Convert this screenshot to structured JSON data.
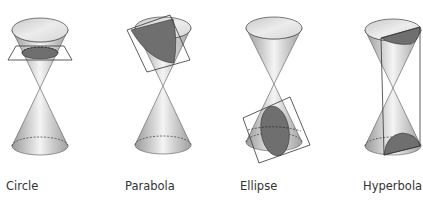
{
  "figure": {
    "panels": [
      {
        "id": "circle",
        "label": "Circle",
        "label_x": 6
      },
      {
        "id": "parabola",
        "label": "Parabola",
        "label_x": 125
      },
      {
        "id": "ellipse",
        "label": "Ellipse",
        "label_x": 240
      },
      {
        "id": "hyperbola",
        "label": "Hyperbola",
        "label_x": 363
      }
    ],
    "colors": {
      "cone_light": "#f2f2f2",
      "cone_mid": "#c4c4c4",
      "cone_dark": "#9a9a9a",
      "section_fill": "#6f6f6f",
      "outline": "#333333"
    }
  }
}
